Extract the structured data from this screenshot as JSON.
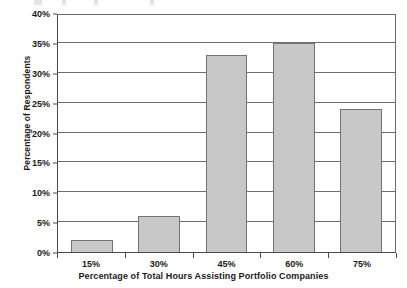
{
  "chart_data": {
    "type": "bar",
    "title": "",
    "categories": [
      "15%",
      "30%",
      "45%",
      "60%",
      "75%"
    ],
    "values": [
      2,
      6,
      33,
      35,
      24
    ],
    "xlabel": "Percentage of Total Hours Assisting Portfolio Companies",
    "ylabel": "Percentage of Respondents",
    "ylim": [
      0,
      40
    ],
    "ytick_labels": [
      "0%",
      "5%",
      "10%",
      "15%",
      "20%",
      "25%",
      "30%",
      "35%",
      "40%"
    ],
    "ytick_values": [
      0,
      5,
      10,
      15,
      20,
      25,
      30,
      35,
      40
    ],
    "grid": true,
    "legend": "none",
    "bar_color": "#c8c8c8",
    "bar_border_color": "#737373",
    "axis_color": "#4a4a4a",
    "gridline_color": "#6e6e6e",
    "text_color": "#1a1a1a"
  }
}
